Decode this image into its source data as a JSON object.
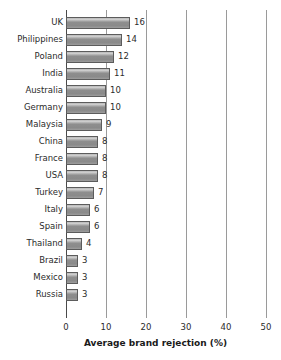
{
  "chart_data": {
    "type": "bar",
    "orientation": "horizontal",
    "title": "",
    "xlabel": "Average brand rejection (%)",
    "ylabel": "",
    "xlim": [
      0,
      50
    ],
    "xticks": [
      0,
      10,
      20,
      30,
      40,
      50
    ],
    "grid": "vertical",
    "legend": "none",
    "categories": [
      "UK",
      "Philippines",
      "Poland",
      "India",
      "Australia",
      "Germany",
      "Malaysia",
      "China",
      "France",
      "USA",
      "Turkey",
      "Italy",
      "Spain",
      "Thailand",
      "Brazil",
      "Mexico",
      "Russia"
    ],
    "values": [
      16,
      14,
      12,
      11,
      10,
      10,
      9,
      8,
      8,
      8,
      7,
      6,
      6,
      4,
      3,
      3,
      3
    ],
    "value_labels": [
      "16",
      "14",
      "12",
      "11",
      "10",
      "10",
      "9",
      "8",
      "8",
      "8",
      "7",
      "6",
      "6",
      "4",
      "3",
      "3",
      "3"
    ],
    "tick_labels": [
      "0",
      "10",
      "20",
      "30",
      "40",
      "50"
    ],
    "colors": {
      "bar_fill_light": "#cfcfcf",
      "bar_fill_dark": "#8a8a8a",
      "bar_border": "#5c5c5c",
      "gridline": "#9a9a9a",
      "axis": "#4a4a4a",
      "text": "#2b2b2b",
      "background": "#ffffff"
    }
  }
}
